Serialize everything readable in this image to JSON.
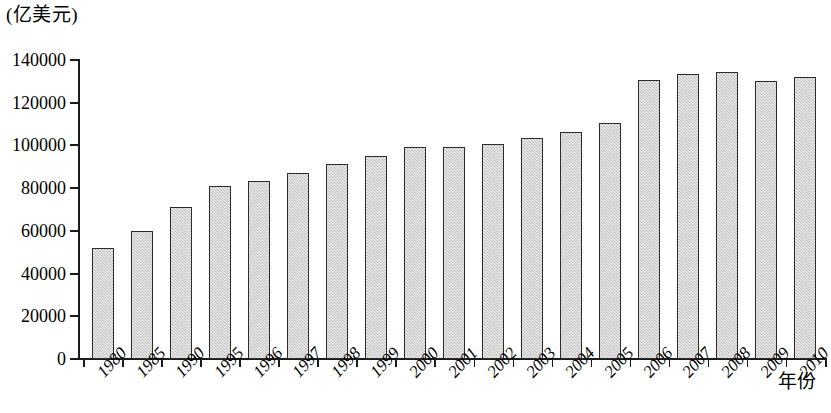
{
  "unit_label": "(亿美元)",
  "xaxis_title": "年份",
  "yticks": [
    "0",
    "20000",
    "40000",
    "60000",
    "80000",
    "100000",
    "120000",
    "140000"
  ],
  "chart_data": {
    "type": "bar",
    "title": "",
    "subtitle": "",
    "xlabel": "年份",
    "ylabel": "(亿美元)",
    "ylim": [
      0,
      140000
    ],
    "ytick_values": [
      0,
      20000,
      40000,
      60000,
      80000,
      100000,
      120000,
      140000
    ],
    "grid": false,
    "legend": false,
    "bar_fill": "#d4d4d4",
    "bar_edge": "#2b2b2b",
    "categories": [
      "1980",
      "1985",
      "1990",
      "1995",
      "1996",
      "1997",
      "1998",
      "1999",
      "2000",
      "2001",
      "2002",
      "2003",
      "2004",
      "2005",
      "2006",
      "2007",
      "2008",
      "2009",
      "2010"
    ],
    "values": [
      52000,
      60000,
      71000,
      81000,
      83500,
      87000,
      91500,
      95000,
      99500,
      99500,
      100500,
      103500,
      106500,
      110500,
      130500,
      133500,
      134500,
      130000,
      132000
    ]
  }
}
